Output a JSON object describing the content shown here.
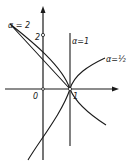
{
  "diagram": {
    "type": "coordinate-plot",
    "axes": {
      "origin_label": "0",
      "x_tick_label": "1",
      "y_tick_label": "2"
    },
    "curves": [
      {
        "id": "alpha-2",
        "label": "α = 2",
        "shape": "parabola opening left, vertex (1,0), y-intercepts ±2"
      },
      {
        "id": "alpha-1",
        "label": "α=1",
        "shape": "vertical line x = 1"
      },
      {
        "id": "alpha-half",
        "label": "α=½",
        "shape": "two branches from (1,0) opening right"
      }
    ],
    "colors": {
      "ink": "#1a1a1a",
      "background": "#ffffff"
    }
  },
  "labels": {
    "alpha2": "α = 2",
    "alpha1": "α=1",
    "alphahalf": "α=½",
    "origin": "0",
    "one": "1",
    "two": "2"
  }
}
